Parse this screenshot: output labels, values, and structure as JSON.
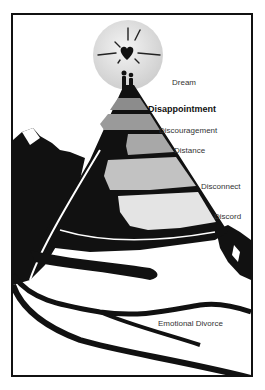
{
  "diagram": {
    "type": "mountain-stages",
    "stages": [
      {
        "label": "Dream",
        "x": 172,
        "y": 78,
        "bold": false
      },
      {
        "label": "Disappointment",
        "x": 148,
        "y": 105,
        "bold": true
      },
      {
        "label": "Discouragement",
        "x": 159,
        "y": 126,
        "bold": false
      },
      {
        "label": "Distance",
        "x": 174,
        "y": 146,
        "bold": false
      },
      {
        "label": "Disconnect",
        "x": 201,
        "y": 182,
        "bold": false
      },
      {
        "label": "Discord",
        "x": 214,
        "y": 212,
        "bold": false
      },
      {
        "label": "Emotional Divorce",
        "x": 158,
        "y": 320,
        "bold": false
      }
    ],
    "colors": {
      "outline": "#111111",
      "sun": "#e2e2e2",
      "layer1": "#8c8c8c",
      "layer2": "#a3a3a3",
      "layer3": "#bdbdbd",
      "layer4": "#d6d6d6",
      "layer5": "#ececec"
    }
  }
}
